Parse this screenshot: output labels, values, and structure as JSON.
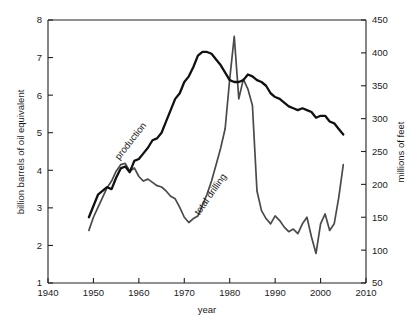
{
  "chart_data": {
    "type": "line",
    "title": "",
    "xlabel": "year",
    "ylabel_left": "billion barrels of oil equivalent",
    "ylabel_right": "millions of feet",
    "xlim": [
      1940,
      2010
    ],
    "ylim_left": [
      1,
      8
    ],
    "ylim_right": [
      50,
      450
    ],
    "xticks": [
      1940,
      1950,
      1960,
      1970,
      1980,
      1990,
      2000,
      2010
    ],
    "yticks_left": [
      1,
      2,
      3,
      4,
      5,
      6,
      7,
      8
    ],
    "yticks_right": [
      50,
      100,
      150,
      200,
      250,
      300,
      350,
      400,
      450
    ],
    "grid": false,
    "legend_position": "inline-annotations",
    "series": [
      {
        "name": "production",
        "axis": "left",
        "units": "billion barrels of oil equivalent",
        "color": "#111111",
        "label_annotation": "production",
        "x": [
          1949,
          1950,
          1951,
          1952,
          1953,
          1954,
          1955,
          1956,
          1957,
          1958,
          1959,
          1960,
          1961,
          1962,
          1963,
          1964,
          1965,
          1966,
          1967,
          1968,
          1969,
          1970,
          1971,
          1972,
          1973,
          1974,
          1975,
          1976,
          1977,
          1978,
          1979,
          1980,
          1981,
          1982,
          1983,
          1984,
          1985,
          1986,
          1987,
          1988,
          1989,
          1990,
          1991,
          1992,
          1993,
          1994,
          1995,
          1996,
          1997,
          1998,
          1999,
          2000,
          2001,
          2002,
          2003,
          2004,
          2005
        ],
        "values": [
          2.75,
          3.05,
          3.35,
          3.45,
          3.55,
          3.5,
          3.8,
          4.05,
          4.1,
          3.95,
          4.25,
          4.3,
          4.45,
          4.6,
          4.8,
          4.85,
          5.0,
          5.3,
          5.6,
          5.9,
          6.05,
          6.35,
          6.5,
          6.75,
          7.05,
          7.15,
          7.15,
          7.1,
          6.95,
          6.8,
          6.6,
          6.4,
          6.35,
          6.35,
          6.4,
          6.55,
          6.5,
          6.4,
          6.35,
          6.25,
          6.05,
          5.95,
          5.9,
          5.8,
          5.7,
          5.65,
          5.6,
          5.65,
          5.6,
          5.55,
          5.4,
          5.45,
          5.45,
          5.3,
          5.25,
          5.1,
          4.95
        ]
      },
      {
        "name": "total drilling",
        "axis": "right",
        "units": "millions of feet",
        "color": "#4a4a4a",
        "label_annotation": "total drilling",
        "x": [
          1949,
          1950,
          1951,
          1952,
          1953,
          1954,
          1955,
          1956,
          1957,
          1958,
          1959,
          1960,
          1961,
          1962,
          1963,
          1964,
          1965,
          1966,
          1967,
          1968,
          1969,
          1970,
          1971,
          1972,
          1973,
          1974,
          1975,
          1976,
          1977,
          1978,
          1979,
          1980,
          1981,
          1982,
          1983,
          1984,
          1985,
          1986,
          1987,
          1988,
          1989,
          1990,
          1991,
          1992,
          1993,
          1994,
          1995,
          1996,
          1997,
          1998,
          1999,
          2000,
          2001,
          2002,
          2003,
          2004,
          2005
        ],
        "x_note": "drilling series plotted on right axis",
        "values": [
          130,
          150,
          165,
          180,
          195,
          205,
          220,
          230,
          232,
          220,
          225,
          212,
          205,
          208,
          203,
          198,
          196,
          190,
          182,
          178,
          165,
          150,
          142,
          148,
          152,
          168,
          185,
          205,
          230,
          255,
          285,
          360,
          425,
          330,
          360,
          345,
          320,
          190,
          160,
          148,
          140,
          152,
          145,
          135,
          128,
          132,
          125,
          140,
          150,
          120,
          95,
          140,
          155,
          130,
          140,
          180,
          230
        ]
      }
    ],
    "annotations": [
      {
        "text": "production",
        "x_approx": 1963,
        "rotation_deg": -52
      },
      {
        "text": "total drilling",
        "x_approx": 1977,
        "rotation_deg": -55
      }
    ]
  },
  "axes": {
    "x_title": "year",
    "y_left_title": "billion barrels of oil equivalent",
    "y_right_title": "millions of feet",
    "x_tick_labels": [
      "1940",
      "1950",
      "1960",
      "1970",
      "1980",
      "1990",
      "2000",
      "2010"
    ],
    "y_left_tick_labels": [
      "1",
      "2",
      "3",
      "4",
      "5",
      "6",
      "7",
      "8"
    ],
    "y_right_tick_labels": [
      "50",
      "100",
      "150",
      "200",
      "250",
      "300",
      "350",
      "400",
      "450"
    ]
  },
  "labels": {
    "production": "production",
    "total_drilling": "total drilling"
  },
  "colors": {
    "production": "#111111",
    "drilling": "#4a4a4a",
    "axis": "#222222",
    "background": "#ffffff"
  }
}
